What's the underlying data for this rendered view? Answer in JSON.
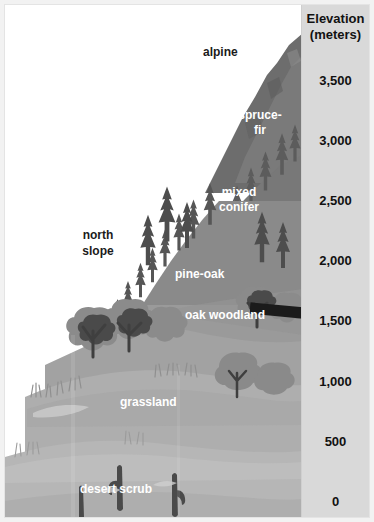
{
  "figure": {
    "kind": "elevation-life-zones-diagram",
    "title_implicit": "Mountain life zones by elevation"
  },
  "scale": {
    "title": "Elevation",
    "units": "(meters)",
    "ticks": [
      {
        "label": "3,500",
        "value": 3500
      },
      {
        "label": "3,000",
        "value": 3000
      },
      {
        "label": "2,500",
        "value": 2500
      },
      {
        "label": "2,000",
        "value": 2000
      },
      {
        "label": "1,500",
        "value": 1500
      },
      {
        "label": "1,000",
        "value": 1000
      },
      {
        "label": "500",
        "value": 500
      },
      {
        "label": "0",
        "value": 0
      }
    ],
    "background_color": "#d9d9d9",
    "text_color": "#111111"
  },
  "zones": [
    {
      "name": "alpine",
      "label": "alpine",
      "style": "dark",
      "has_leader_line": true
    },
    {
      "name": "spruce-fir",
      "label_line1": "spruce-",
      "label_line2": "fir",
      "style": "white"
    },
    {
      "name": "mixed-conifer",
      "label_line1": "mixed",
      "label_line2": "conifer",
      "style": "white"
    },
    {
      "name": "pine-oak",
      "label": "pine-oak",
      "style": "white"
    },
    {
      "name": "oak-woodland",
      "label": "oak woodland",
      "style": "white"
    },
    {
      "name": "grassland",
      "label": "grassland",
      "style": "white"
    },
    {
      "name": "desert-scrub",
      "label": "desert scrub",
      "style": "white"
    }
  ],
  "annotations": [
    {
      "name": "north-slope",
      "label_line1": "north",
      "label_line2": "slope",
      "style": "dark"
    }
  ],
  "colors": {
    "page_background": "#f2f2f2",
    "frame_background": "#ffffff",
    "scale_panel": "#d9d9d9",
    "sky": "#ffffff",
    "peak_dark": "#6b6b6b",
    "upper_slope": "#7d7d7d",
    "mid_slope": "#8d8d8d",
    "lower_slope": "#9e9e9e",
    "grassland": "#ababab",
    "desert": "#b4b4b4",
    "tree_dark": "#4f4f4f",
    "label_white": "#ffffff",
    "label_dark": "#1b1b1b"
  }
}
